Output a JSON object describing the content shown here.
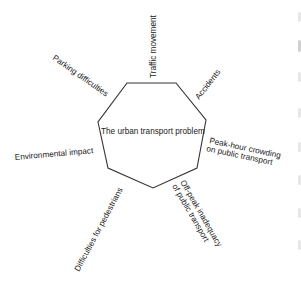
{
  "diagram": {
    "center_label": "The urban transport problem",
    "stroke_color": "#333333",
    "text_color": "#222222",
    "polygon_points": "127,83 176,83 206,120 197,168 153,188 108,168 98,122",
    "labels": [
      {
        "id": "traffic-movement",
        "text": "Traffic movement"
      },
      {
        "id": "accidents",
        "text": "Accidents"
      },
      {
        "id": "peak-hour-line1",
        "text": "Peak-hour crowding"
      },
      {
        "id": "peak-hour-line2",
        "text": "on public transport"
      },
      {
        "id": "off-peak-line1",
        "text": "Off-peak inadequacy"
      },
      {
        "id": "off-peak-line2",
        "text": "of public transport"
      },
      {
        "id": "pedestrians",
        "text": "Difficulties for pedestrians"
      },
      {
        "id": "environmental",
        "text": "Environmental impact"
      },
      {
        "id": "parking",
        "text": "Parking difficulties"
      }
    ]
  }
}
